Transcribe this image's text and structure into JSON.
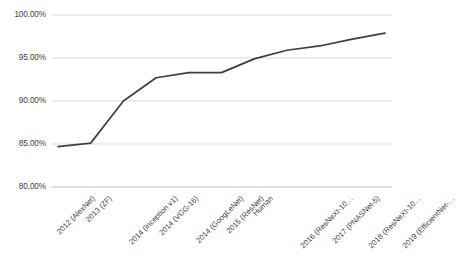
{
  "chart_data": {
    "type": "line",
    "title": "",
    "xlabel": "",
    "ylabel": "",
    "ylim": [
      80,
      100
    ],
    "ytick_values": [
      100,
      95,
      90,
      85,
      80
    ],
    "ytick_labels": [
      "100.00%",
      "95.00%",
      "90.00%",
      "85.00%",
      "80.00%"
    ],
    "grid": true,
    "legend": "none",
    "line_color": "#3f3f3f",
    "categories": [
      "2012 (AlexNet)",
      "2013 (ZF)",
      "2014 (Inception v1)",
      "2014 (VGG-16)",
      "2014 (GoogLeNet)",
      "2015 (ResNet)",
      "Human",
      "2016 (ResNeXt-10…",
      "2017 (PNASNet-5)",
      "2018 (ResNeXt-10…",
      "2019 (EfficientNet-…"
    ],
    "values": [
      84.7,
      85.1,
      90.0,
      92.7,
      93.3,
      93.3,
      94.9,
      95.9,
      96.4,
      97.2,
      97.9
    ]
  }
}
